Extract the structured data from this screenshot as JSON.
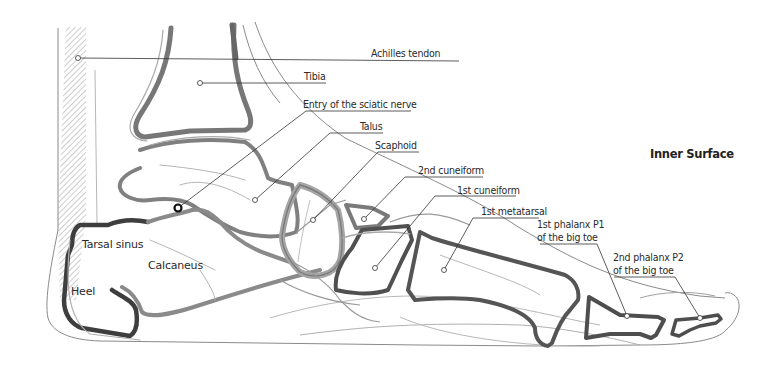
{
  "title": "Inner Surface",
  "colors": {
    "bone_dark": "#4a4a4a",
    "bone_mid": "#777777",
    "bone_light": "#a8a8a8",
    "outline": "#8a8a8a",
    "leader": "#333333",
    "text": "#2a2a2a"
  },
  "callouts": [
    {
      "id": "achilles",
      "label": "Achilles tendon"
    },
    {
      "id": "tibia",
      "label": "Tibia"
    },
    {
      "id": "sciatic",
      "label": "Entry of the sciatic nerve"
    },
    {
      "id": "talus",
      "label": "Talus"
    },
    {
      "id": "scaphoid",
      "label": "Scaphoid"
    },
    {
      "id": "cuneiform2",
      "label": "2nd cuneiform"
    },
    {
      "id": "cuneiform1",
      "label": "1st cuneiform"
    },
    {
      "id": "metatarsal1",
      "label": "1st metatarsal"
    },
    {
      "id": "phalanx1",
      "label_line1": "1st phalanx P1",
      "label_line2": "of the big toe"
    },
    {
      "id": "phalanx2",
      "label_line1": "2nd phalanx P2",
      "label_line2": "of the big toe"
    }
  ],
  "inline_labels": {
    "tarsal_sinus": "Tarsal sinus",
    "calcaneus": "Calcaneus",
    "heel": "Heel"
  }
}
